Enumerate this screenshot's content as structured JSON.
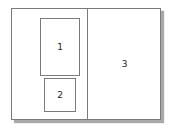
{
  "diagram": {
    "regions": [
      {
        "id": "1",
        "label": "1"
      },
      {
        "id": "2",
        "label": "2"
      },
      {
        "id": "3",
        "label": "3"
      }
    ],
    "colors": {
      "border": "#7a7a7a",
      "shadow": "#a9a9a9",
      "background": "#ffffff"
    }
  }
}
